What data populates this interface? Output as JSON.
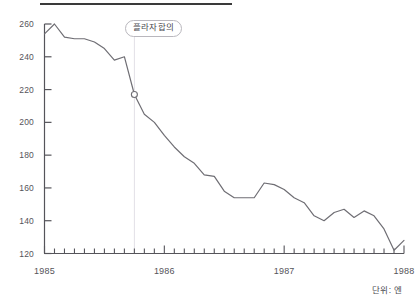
{
  "chart_data": {
    "type": "line",
    "title": "",
    "xlabel": "",
    "ylabel": "",
    "unit_note": "단위: 엔",
    "ylim": [
      120,
      260
    ],
    "y_ticks": [
      120,
      140,
      160,
      180,
      200,
      220,
      240,
      260
    ],
    "x_ticks": [
      "1985",
      "1986",
      "1987",
      "1988"
    ],
    "x_tick_values": [
      1985,
      1986,
      1987,
      1988
    ],
    "xlim": [
      1985,
      1988
    ],
    "grid": false,
    "legend": null,
    "minor_tick_interval_months": 1,
    "series": [
      {
        "name": "USD/JPY",
        "x": [
          1985.0,
          1985.083,
          1985.167,
          1985.25,
          1985.333,
          1985.417,
          1985.5,
          1985.583,
          1985.667,
          1985.75,
          1985.833,
          1985.917,
          1986.0,
          1986.083,
          1986.167,
          1986.25,
          1986.333,
          1986.417,
          1986.5,
          1986.583,
          1986.667,
          1986.75,
          1986.833,
          1986.917,
          1987.0,
          1987.083,
          1987.167,
          1987.25,
          1987.333,
          1987.417,
          1987.5,
          1987.583,
          1987.667,
          1987.75,
          1987.833,
          1987.917,
          1988.0
        ],
        "values": [
          254,
          260,
          252,
          251,
          251,
          249,
          245,
          238,
          240,
          217,
          205,
          200,
          192,
          185,
          179,
          175,
          168,
          167,
          158,
          154,
          154,
          154,
          163,
          162,
          159,
          154,
          151,
          143,
          140,
          145,
          147,
          142,
          146,
          143,
          135,
          122,
          128
        ]
      }
    ],
    "markers": [
      {
        "name": "plaza-accord-marker",
        "x": 1985.75,
        "y": 217,
        "style": "open-circle"
      }
    ],
    "annotations": [
      {
        "name": "plaza-accord-label",
        "text": "플라자합의",
        "x": 1985.75,
        "guideline": true
      }
    ],
    "colors": {
      "line": "#6f6e74",
      "axis": "#55545a",
      "tick_text": "#55545a",
      "guideline": "#e2e0e6",
      "top_rule": "#3a3a3a",
      "annotation_border": "#b9b7bd",
      "background": "#ffffff"
    }
  }
}
